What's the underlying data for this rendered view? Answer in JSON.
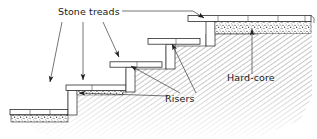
{
  "figure": {
    "type": "technical-line-drawing",
    "background_color": "#ffffff",
    "line_color": "#1e1e1e",
    "text_color": "#1a1a1a"
  },
  "labels": {
    "stone_treads": "Stone treads",
    "risers": "Risers",
    "hard_core": "Hard-core"
  },
  "label_positions": {
    "stone_treads": {
      "x": 58,
      "y": 15
    },
    "risers": {
      "x": 165,
      "y": 102
    },
    "hard_core": {
      "x": 227,
      "y": 81
    }
  },
  "icons": {
    "arrow_head": "arrowhead-triangle",
    "hatch": "diagonal-hatch-fill",
    "stipple": "stipple-aggregate-fill"
  },
  "annotations": {
    "stone_treads_leader_count": 4,
    "risers_leader_count": 3,
    "hard_core_leader_count": 1
  },
  "steps": [
    {
      "name": "step-1-bottom",
      "tread_x": 10,
      "tread_y": 110,
      "tread_w": 58,
      "tread_h": 5
    },
    {
      "name": "step-2",
      "tread_x": 68,
      "tread_y": 85,
      "tread_w": 58,
      "tread_h": 5
    },
    {
      "name": "step-3",
      "tread_x": 110,
      "tread_y": 62,
      "tread_w": 52,
      "tread_h": 5
    },
    {
      "name": "step-4",
      "tread_x": 148,
      "tread_y": 39,
      "tread_w": 52,
      "tread_h": 5
    },
    {
      "name": "step-5-top-paving",
      "tread_x": 188,
      "tread_y": 16,
      "tread_w": 122,
      "tread_h": 5
    }
  ]
}
